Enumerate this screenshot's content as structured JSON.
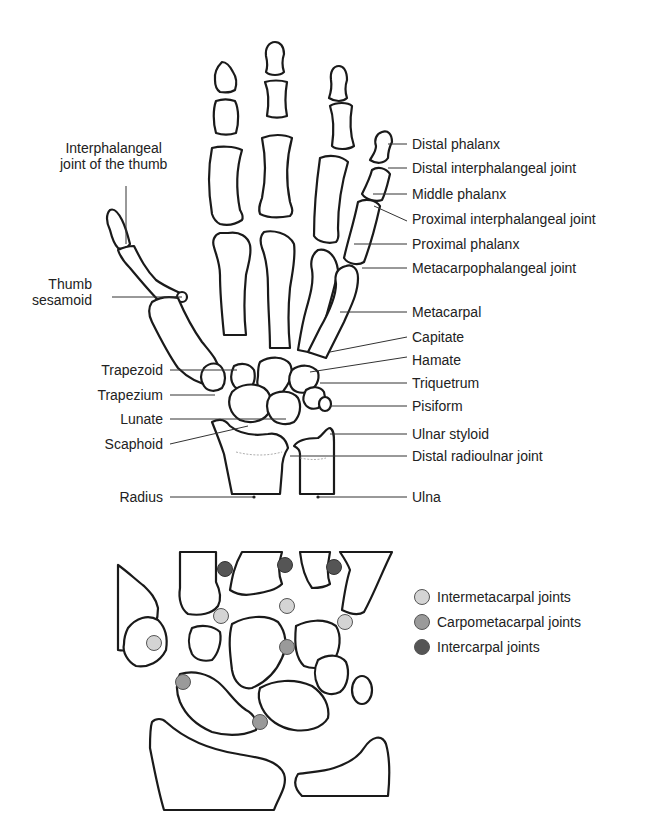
{
  "figure": {
    "top_view": "Dorsal view of hand and wrist skeleton",
    "bottom_view": "Wrist joint schematic"
  },
  "labels_left": [
    {
      "id": "ip-thumb",
      "lines": [
        "Interphalangeal",
        "joint of the thumb"
      ]
    },
    {
      "id": "thumb-sesamoid",
      "lines": [
        "Thumb",
        "sesamoid"
      ]
    },
    {
      "id": "trapezoid",
      "text": "Trapezoid"
    },
    {
      "id": "trapezium",
      "text": "Trapezium"
    },
    {
      "id": "lunate",
      "text": "Lunate"
    },
    {
      "id": "scaphoid",
      "text": "Scaphoid"
    },
    {
      "id": "radius",
      "text": "Radius"
    }
  ],
  "labels_right": [
    {
      "id": "distal-phalanx",
      "text": "Distal phalanx"
    },
    {
      "id": "dip-joint",
      "text": "Distal interphalangeal joint"
    },
    {
      "id": "middle-phalanx",
      "text": "Middle phalanx"
    },
    {
      "id": "pip-joint",
      "text": "Proximal interphalangeal joint"
    },
    {
      "id": "proximal-phalanx",
      "text": "Proximal phalanx"
    },
    {
      "id": "mcp-joint",
      "text": "Metacarpophalangeal joint"
    },
    {
      "id": "metacarpal",
      "text": "Metacarpal"
    },
    {
      "id": "capitate",
      "text": "Capitate"
    },
    {
      "id": "hamate",
      "text": "Hamate"
    },
    {
      "id": "triquetrum",
      "text": "Triquetrum"
    },
    {
      "id": "pisiform",
      "text": "Pisiform"
    },
    {
      "id": "ulnar-styloid",
      "text": "Ulnar styloid"
    },
    {
      "id": "druj",
      "text": "Distal radioulnar joint"
    },
    {
      "id": "ulna",
      "text": "Ulna"
    }
  ],
  "legend": [
    {
      "label": "Intermetacarpal joints",
      "color": "#d4d4d4"
    },
    {
      "label": "Carpometacarpal joints",
      "color": "#9a9a9a"
    },
    {
      "label": "Intercarpal joints",
      "color": "#555555"
    }
  ]
}
